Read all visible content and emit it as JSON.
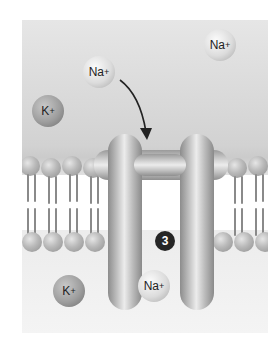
{
  "diagram": {
    "title": "",
    "step_number": "3",
    "ions": [
      {
        "id": "na-upper-left",
        "symbol": "Na",
        "charge": "+",
        "type": "sodium",
        "region": "extracellular"
      },
      {
        "id": "na-upper-right",
        "symbol": "Na",
        "charge": "+",
        "type": "sodium",
        "region": "extracellular"
      },
      {
        "id": "k-upper",
        "symbol": "K",
        "charge": "+",
        "type": "potassium",
        "region": "extracellular"
      },
      {
        "id": "k-lower",
        "symbol": "K",
        "charge": "+",
        "type": "potassium",
        "region": "intracellular"
      },
      {
        "id": "na-lower",
        "symbol": "Na",
        "charge": "+",
        "type": "sodium",
        "region": "intracellular"
      }
    ],
    "arrow": {
      "from": "na-upper-left",
      "to": "channel-protein",
      "label": ""
    },
    "structures": {
      "membrane": "phospholipid-bilayer",
      "channel": "transmembrane-protein"
    },
    "colors": {
      "background": "#ffffff",
      "extracellular": "#d6d6d6",
      "intracellular": "#f2f2f2",
      "step_badge": "#262626"
    }
  }
}
